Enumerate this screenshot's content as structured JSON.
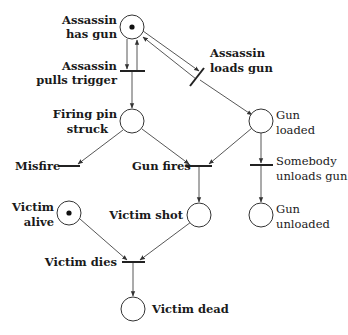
{
  "diagram": {
    "type": "petri-net",
    "places": [
      {
        "id": "assassin_has_gun",
        "label_lines": [
          "Assassin",
          "has gun"
        ],
        "tokens": 1
      },
      {
        "id": "firing_pin_struck",
        "label_lines": [
          "Firing pin",
          "struck"
        ],
        "tokens": 0
      },
      {
        "id": "gun_loaded",
        "label_lines": [
          "Gun",
          "loaded"
        ],
        "tokens": 0
      },
      {
        "id": "victim_alive",
        "label_lines": [
          "Victim",
          "alive"
        ],
        "tokens": 1
      },
      {
        "id": "victim_shot",
        "label_lines": [
          "Victim shot"
        ],
        "tokens": 0
      },
      {
        "id": "gun_unloaded",
        "label_lines": [
          "Gun",
          "unloaded"
        ],
        "tokens": 0
      },
      {
        "id": "victim_dead",
        "label_lines": [
          "Victim dead"
        ],
        "tokens": 0
      }
    ],
    "transitions": [
      {
        "id": "assassin_pulls_trigger",
        "label_lines": [
          "Assassin",
          "pulls trigger"
        ]
      },
      {
        "id": "assassin_loads_gun",
        "label_lines": [
          "Assassin",
          "loads gun"
        ]
      },
      {
        "id": "misfire",
        "label_lines": [
          "Misfire"
        ]
      },
      {
        "id": "gun_fires",
        "label_lines": [
          "Gun fires"
        ]
      },
      {
        "id": "somebody_unloads_gun",
        "label_lines": [
          "Somebody",
          "unloads gun"
        ]
      },
      {
        "id": "victim_dies",
        "label_lines": [
          "Victim dies"
        ]
      }
    ],
    "arcs": [
      {
        "from": "assassin_has_gun",
        "to": "assassin_pulls_trigger"
      },
      {
        "from": "assassin_pulls_trigger",
        "to": "assassin_has_gun"
      },
      {
        "from": "assassin_pulls_trigger",
        "to": "firing_pin_struck"
      },
      {
        "from": "assassin_has_gun",
        "to": "assassin_loads_gun"
      },
      {
        "from": "assassin_loads_gun",
        "to": "assassin_has_gun"
      },
      {
        "from": "assassin_loads_gun",
        "to": "gun_loaded"
      },
      {
        "from": "firing_pin_struck",
        "to": "misfire"
      },
      {
        "from": "firing_pin_struck",
        "to": "gun_fires"
      },
      {
        "from": "gun_loaded",
        "to": "gun_fires"
      },
      {
        "from": "gun_loaded",
        "to": "somebody_unloads_gun"
      },
      {
        "from": "gun_fires",
        "to": "victim_shot"
      },
      {
        "from": "somebody_unloads_gun",
        "to": "gun_unloaded"
      },
      {
        "from": "victim_alive",
        "to": "victim_dies"
      },
      {
        "from": "victim_shot",
        "to": "victim_dies"
      },
      {
        "from": "victim_dies",
        "to": "victim_dead"
      }
    ]
  }
}
